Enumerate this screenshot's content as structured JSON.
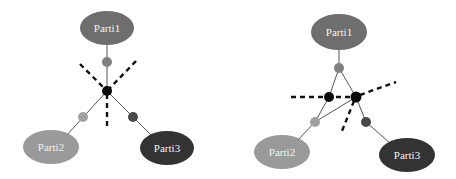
{
  "colors": {
    "background": "#ffffff",
    "parti1": "#6e6e6e",
    "parti2": "#9a9a9a",
    "parti3": "#333333",
    "label_text": "#f2f2f2",
    "node_mid": "#808080",
    "node_light": "#a0a0a0",
    "node_dark": "#4a4a4a",
    "node_hub": "#0a0a0a",
    "edge": "#555555",
    "cut_line": "#111111"
  },
  "diagrams": [
    {
      "id": "left",
      "parties": [
        {
          "label": "Parti1"
        },
        {
          "label": "Parti2"
        },
        {
          "label": "Parti3"
        }
      ],
      "hub_count": 1,
      "cut_lines": 3
    },
    {
      "id": "right",
      "parties": [
        {
          "label": "Parti1"
        },
        {
          "label": "Parti2"
        },
        {
          "label": "Parti3"
        }
      ],
      "hub_count": 2,
      "cut_lines": 3
    }
  ]
}
